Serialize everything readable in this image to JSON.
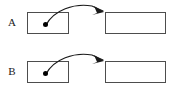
{
  "figure": {
    "background_color": "#ffffff",
    "width": 172,
    "height": 97,
    "stroke_color": "#4d4d4d",
    "arrow_color": "#1a1a1a",
    "dot_color": "#000000"
  },
  "panels": [
    {
      "label": "A",
      "source_box": {
        "text": ""
      },
      "target_box": {
        "text": ""
      },
      "dot": {
        "label": ""
      },
      "arrow": {
        "label": ""
      }
    },
    {
      "label": "B",
      "source_box": {
        "text": ""
      },
      "target_box": {
        "text": ""
      },
      "dot": {
        "label": ""
      },
      "arrow": {
        "label": ""
      }
    }
  ]
}
